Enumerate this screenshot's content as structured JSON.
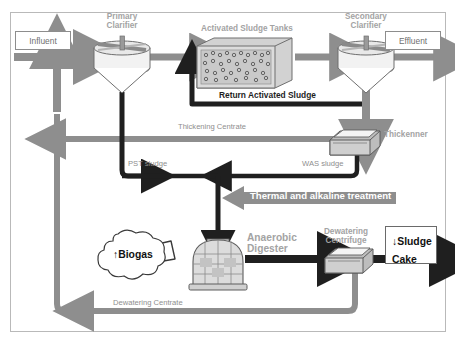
{
  "diagram": {
    "colors": {
      "frame": "#b9b9b9",
      "gray_arrow": "#8e8e8e",
      "dark_arrow": "#1f1f1f",
      "unit_label": "#a3a3a3",
      "flow_label": "#8e8e8e",
      "treatment_arrow": "#8e8e8e",
      "tank_fill": "#d9d9d9",
      "background": "#ffffff"
    }
  },
  "boxes": {
    "influent": "Influent",
    "effluent": "Effluent",
    "sludge_cake": "↓Sludge\nCake",
    "biogas": "↑Biogas"
  },
  "units": {
    "primary_clarifier": "Primary\nClarifier",
    "activated_sludge_tanks": "Activated Sludge Tanks",
    "secondary_clarifier": "Secondary\nClarifier",
    "thickener": "Thickenner",
    "anaerobic_digester": "Anaerobic\nDigester",
    "dewatering_centrifuge": "Dewatering\nCentrifuge"
  },
  "flows": {
    "return_activated_sludge": "Return Activated Sludge",
    "thickening_centrate": "Thickening Centrate",
    "pst_sludge": "PST sludge",
    "was_sludge": "WAS sludge",
    "dewatering_centrate": "Dewatering Centrate",
    "thermal_alkaline_treatment": "Thermal and alkaline treatment"
  }
}
